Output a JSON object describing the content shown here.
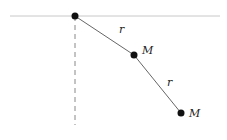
{
  "diagram": {
    "labels": {
      "rod1": "r",
      "rod2": "r",
      "mass1": "M",
      "mass2": "M"
    },
    "colors": {
      "ceiling": "#c8c8c8",
      "rod": "#666666",
      "dashed": "#888888",
      "bob": "#111111"
    }
  }
}
